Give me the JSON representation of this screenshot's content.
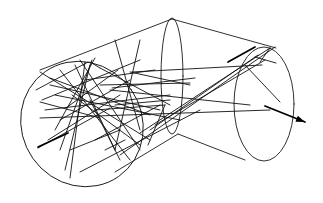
{
  "diagram": {
    "type": "ray-trace-light-pipe",
    "colors": {
      "background": "#ffffff",
      "line": "#111111"
    },
    "outline": {
      "left_ellipse": {
        "cx": 82,
        "cy": 124,
        "rx": 60,
        "ry": 64,
        "rotate": -35
      },
      "mid_ellipse": {
        "cx": 172,
        "cy": 76,
        "rx": 11,
        "ry": 58
      },
      "right_ellipse": {
        "cx": 264,
        "cy": 104,
        "rx": 30,
        "ry": 57
      },
      "edges": [
        [
          40,
          70,
          172,
          19
        ],
        [
          172,
          19,
          276,
          48
        ],
        [
          115,
          172,
          178,
          134
        ],
        [
          178,
          134,
          245,
          160
        ]
      ]
    },
    "rays": [
      [
        36,
        90,
        88,
        62
      ],
      [
        40,
        72,
        150,
        140
      ],
      [
        45,
        110,
        170,
        95
      ],
      [
        40,
        118,
        270,
        110
      ],
      [
        50,
        85,
        160,
        110
      ],
      [
        42,
        100,
        140,
        60
      ],
      [
        55,
        130,
        95,
        58
      ],
      [
        60,
        150,
        92,
        60
      ],
      [
        65,
        170,
        90,
        65
      ],
      [
        70,
        178,
        85,
        62
      ],
      [
        48,
        140,
        120,
        95
      ],
      [
        38,
        148,
        110,
        108
      ],
      [
        55,
        95,
        180,
        120
      ],
      [
        60,
        70,
        130,
        160
      ],
      [
        75,
        65,
        115,
        150
      ],
      [
        80,
        60,
        140,
        150
      ],
      [
        90,
        62,
        100,
        68
      ],
      [
        100,
        68,
        170,
        105
      ],
      [
        115,
        40,
        140,
        130
      ],
      [
        140,
        40,
        115,
        150
      ],
      [
        130,
        72,
        190,
        85
      ],
      [
        132,
        72,
        262,
        65
      ],
      [
        100,
        85,
        190,
        83
      ],
      [
        110,
        90,
        250,
        105
      ],
      [
        115,
        105,
        170,
        100
      ],
      [
        140,
        133,
        270,
        48
      ],
      [
        150,
        130,
        258,
        55
      ],
      [
        155,
        125,
        265,
        60
      ],
      [
        80,
        172,
        200,
        110
      ],
      [
        120,
        155,
        275,
        47
      ],
      [
        148,
        145,
        165,
        105
      ],
      [
        95,
        110,
        165,
        105
      ],
      [
        40,
        102,
        100,
        118
      ],
      [
        60,
        120,
        130,
        80
      ],
      [
        72,
        95,
        140,
        145
      ],
      [
        85,
        80,
        155,
        70
      ],
      [
        112,
        88,
        195,
        78
      ],
      [
        50,
        78,
        150,
        115
      ],
      [
        66,
        108,
        118,
        70
      ],
      [
        95,
        140,
        160,
        105
      ],
      [
        255,
        57,
        276,
        63
      ],
      [
        260,
        62,
        270,
        48
      ],
      [
        70,
        150,
        120,
        130
      ],
      [
        90,
        100,
        120,
        160
      ],
      [
        105,
        150,
        125,
        140
      ],
      [
        245,
        65,
        280,
        102
      ]
    ],
    "bold_rays": [
      [
        38,
        147,
        68,
        133
      ],
      [
        265,
        106,
        305,
        122
      ],
      [
        228,
        62,
        255,
        47
      ]
    ],
    "arrow": {
      "tip_x": 305,
      "tip_y": 122,
      "from_x": 265,
      "from_y": 106
    }
  }
}
